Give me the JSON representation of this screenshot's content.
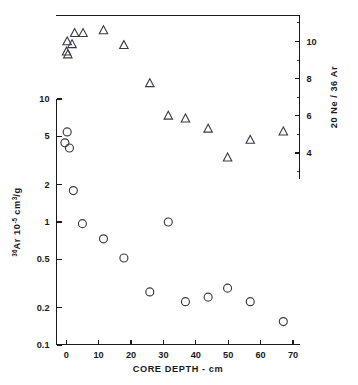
{
  "chart_data": {
    "type": "scatter",
    "title": "",
    "xlabel": "CORE DEPTH - cm",
    "xlim": [
      -3,
      72
    ],
    "xticks": [
      0,
      10,
      20,
      30,
      40,
      50,
      60,
      70
    ],
    "xticklabels": [
      "0",
      "10",
      "20",
      "30",
      "40",
      "50",
      "60",
      "70"
    ],
    "grid": false,
    "legend": "none",
    "left_axis": {
      "label_prefix": "36",
      "label_main": "Ar  10",
      "label_exp": "-5",
      "label_unit_pre": " cm",
      "label_unit_sup": "3",
      "label_unit_post": "/g",
      "label_plain": "36Ar 10-5 cm3/g",
      "scale": "log",
      "ylim": [
        0.1,
        10
      ],
      "yticks": [
        10,
        5,
        2,
        1,
        0.5,
        0.2,
        0.1
      ],
      "yticklabels": [
        "10",
        "5",
        "2",
        "1",
        "0.5",
        "0.2",
        "0.1"
      ]
    },
    "right_axis": {
      "label_plain": "20 Ne / 36 Ar",
      "label_sup1": "20",
      "label_mid1": "Ne /",
      "label_sup2": "36",
      "label_mid2": "Ar",
      "scale": "linear",
      "ylim": [
        2.6,
        11.4
      ],
      "yticks": [
        4,
        6,
        8,
        10
      ],
      "yticklabels": [
        "4",
        "6",
        "8",
        "10"
      ],
      "minor_ticks": [
        3,
        5,
        7,
        9,
        11
      ]
    },
    "series": [
      {
        "name": "36Ar",
        "marker": "circle",
        "axis": "left",
        "points": [
          {
            "x": 0.3,
            "y": 5.4
          },
          {
            "x": -0.4,
            "y": 4.4
          },
          {
            "x": 1.0,
            "y": 4.0
          },
          {
            "x": 2.2,
            "y": 1.8
          },
          {
            "x": 5.0,
            "y": 0.97
          },
          {
            "x": 11.5,
            "y": 0.73
          },
          {
            "x": 17.8,
            "y": 0.51
          },
          {
            "x": 25.8,
            "y": 0.27
          },
          {
            "x": 31.5,
            "y": 1.0
          },
          {
            "x": 36.8,
            "y": 0.225
          },
          {
            "x": 43.8,
            "y": 0.245
          },
          {
            "x": 49.8,
            "y": 0.29
          },
          {
            "x": 56.8,
            "y": 0.225
          },
          {
            "x": 67.0,
            "y": 0.155
          }
        ]
      },
      {
        "name": "20Ne/36Ar",
        "marker": "triangle",
        "axis": "right",
        "points": [
          {
            "x": 0.3,
            "y": 10.0
          },
          {
            "x": 0.1,
            "y": 9.45
          },
          {
            "x": 0.5,
            "y": 9.3
          },
          {
            "x": 1.8,
            "y": 9.85
          },
          {
            "x": 2.6,
            "y": 10.45
          },
          {
            "x": 5.2,
            "y": 10.45
          },
          {
            "x": 11.5,
            "y": 10.6
          },
          {
            "x": 17.8,
            "y": 9.8
          },
          {
            "x": 25.8,
            "y": 7.75
          },
          {
            "x": 31.5,
            "y": 6.0
          },
          {
            "x": 36.8,
            "y": 5.85
          },
          {
            "x": 43.8,
            "y": 5.3
          },
          {
            "x": 49.8,
            "y": 3.75
          },
          {
            "x": 56.8,
            "y": 4.7
          },
          {
            "x": 67.0,
            "y": 5.15
          }
        ]
      }
    ]
  },
  "figure": {
    "xaxis_title": "CORE DEPTH - cm",
    "left_title_plain": "36Ar 10-5 cm3/g",
    "right_title_plain": "20 Ne / 36 Ar"
  }
}
